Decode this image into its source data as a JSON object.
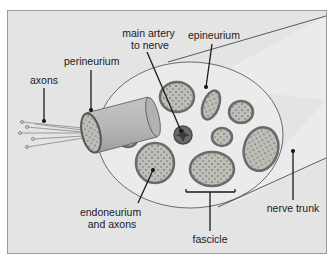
{
  "diagram": {
    "type": "anatomical cross-section",
    "colors": {
      "frame_bg": "#e4e4e4",
      "frame_border": "#9a9a9a",
      "trunk_fill": "#ececec",
      "fascicle_ring": "#6e6e6e",
      "fascicle_fill": "#b9bdb2",
      "dot": "#8a8a8a",
      "artery": "#5a5a5a",
      "cylinder": "#b4b4b4",
      "line": "#1a1a1a"
    },
    "labels": {
      "axons": "axons",
      "perineurium": "perineurium",
      "artery_line1": "main artery",
      "artery_line2": "to nerve",
      "epineurium": "epineurium",
      "endoneurium_line1": "endoneurium",
      "endoneurium_line2": "and axons",
      "fascicle": "fascicle",
      "nerve_trunk": "nerve trunk"
    }
  }
}
